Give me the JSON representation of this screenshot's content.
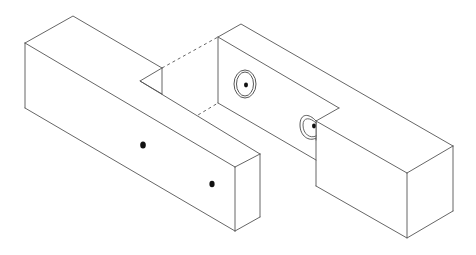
{
  "diagram": {
    "colors": {
      "line": "#555555",
      "background": "#ffffff",
      "dot": "#111111"
    },
    "parts": [
      {
        "id": "left-block",
        "label": "Left block with tongue",
        "features": [
          "two dowel dots on front face",
          "triangular notch on top"
        ]
      },
      {
        "id": "right-block",
        "label": "Right block with lap cut-out",
        "features": [
          "two counterbored dowel holes on inner face",
          "hidden edges shown dashed"
        ]
      }
    ]
  }
}
